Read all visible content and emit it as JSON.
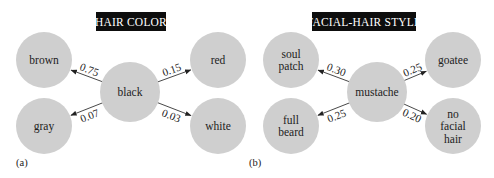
{
  "panels": [
    {
      "id": "a",
      "label": "(a)",
      "title": "HAIR COLOR",
      "center": {
        "name": "black",
        "lines": [
          "black"
        ]
      },
      "targets": [
        {
          "name": "brown",
          "lines": [
            "brown"
          ],
          "position": "top-left",
          "probability": "0.75"
        },
        {
          "name": "red",
          "lines": [
            "red"
          ],
          "position": "top-right",
          "probability": "0.15"
        },
        {
          "name": "gray",
          "lines": [
            "gray"
          ],
          "position": "bottom-left",
          "probability": "0.07"
        },
        {
          "name": "white",
          "lines": [
            "white"
          ],
          "position": "bottom-right",
          "probability": "0.03"
        }
      ]
    },
    {
      "id": "b",
      "label": "(b)",
      "title": "FACIAL-HAIR STYLE",
      "center": {
        "name": "mustache",
        "lines": [
          "mustache"
        ]
      },
      "targets": [
        {
          "name": "soul patch",
          "lines": [
            "soul",
            "patch"
          ],
          "position": "top-left",
          "probability": "0.30"
        },
        {
          "name": "goatee",
          "lines": [
            "goatee"
          ],
          "position": "top-right",
          "probability": "0.25"
        },
        {
          "name": "full beard",
          "lines": [
            "full",
            "beard"
          ],
          "position": "bottom-left",
          "probability": "0.25"
        },
        {
          "name": "no facial hair",
          "lines": [
            "no",
            "facial",
            "hair"
          ],
          "position": "bottom-right",
          "probability": "0.20"
        }
      ]
    }
  ],
  "colors": {
    "node_fill": "#cfcfcf",
    "title_bg": "#0d0d0d",
    "title_text": "#ffffff",
    "edge": "#333333"
  }
}
